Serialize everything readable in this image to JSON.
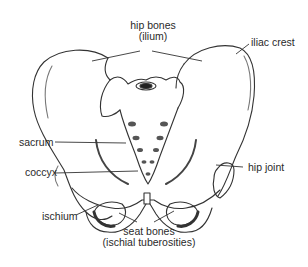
{
  "diagram": {
    "view": "anterior",
    "colors": {
      "line": "#333333",
      "shade": "#555555",
      "background": "#ffffff"
    },
    "labels": {
      "hip_bones": {
        "line1": "hip bones",
        "line2": "(ilium)"
      },
      "iliac_crest": "iliac crest",
      "sacrum": "sacrum",
      "coccyx": "coccyx",
      "hip_joint": "hip joint",
      "ischium": "ischium",
      "seat_bones": {
        "line1": "seat bones",
        "line2": "(ischial tuberosities)"
      }
    }
  }
}
